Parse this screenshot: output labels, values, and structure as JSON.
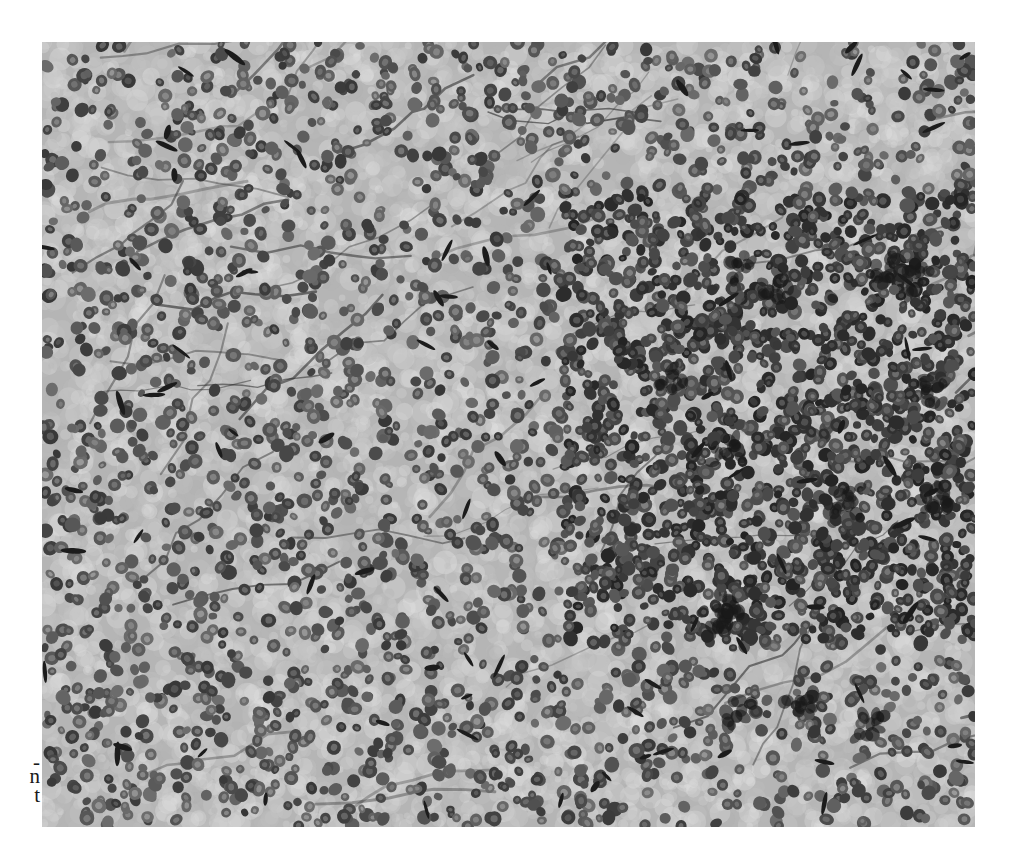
{
  "page": {
    "background": "#ffffff"
  },
  "caption_fragments": [
    {
      "text": "-",
      "top": 752
    },
    {
      "text": "n",
      "top": 766
    },
    {
      "text": "t",
      "top": 785
    }
  ],
  "micrograph": {
    "subject": "histology micrograph - densely packed cells with round nuclei",
    "color_mode": "grayscale",
    "position": {
      "left": 42,
      "top": 42,
      "width": 933,
      "height": 785
    },
    "colors": {
      "background_light": "#d6d6d6",
      "background_mid": "#b5b5b5",
      "cytoplasm": "#c4c4c4",
      "nucleus_dark": "#2e2e2e",
      "nucleus_mid": "#5a5a5a",
      "stroma_dark": "#1c1c1c"
    },
    "nucleus_count": 3800,
    "dense_region": {
      "x": 520,
      "y": 150,
      "w": 413,
      "h": 450
    }
  }
}
